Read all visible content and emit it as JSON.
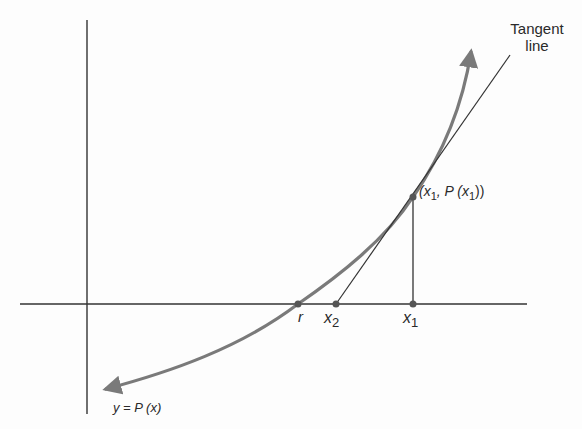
{
  "diagram": {
    "colors": {
      "axes": "#333333",
      "curve": "#7a7a7a",
      "tangent": "#333333",
      "points": "#555555",
      "text": "#2a2a2a"
    },
    "labels": {
      "tangent_line_1": "Tangent",
      "tangent_line_2": "line",
      "point_open": "(x",
      "point_sub1": "1",
      "point_mid": ", P (x",
      "point_sub2": "1",
      "point_close": "))",
      "root": "r",
      "x2_base": "x",
      "x2_sub": "2",
      "x1_base": "x",
      "x1_sub": "1",
      "curve": "y = P (x)"
    },
    "geometry": {
      "x_axis": {
        "x1": 20,
        "x2": 527,
        "y": 304
      },
      "y_axis": {
        "x": 87,
        "y1": 20,
        "y2": 414
      },
      "points": {
        "r": [
          298,
          304
        ],
        "x2": [
          336,
          304
        ],
        "x1": [
          413,
          304
        ],
        "tangent_point": [
          413,
          197
        ]
      },
      "tangent_line": {
        "from": [
          336,
          304
        ],
        "to": [
          510,
          55
        ]
      },
      "vertical_segment": {
        "from": [
          413,
          304
        ],
        "to": [
          413,
          197
        ]
      }
    }
  }
}
